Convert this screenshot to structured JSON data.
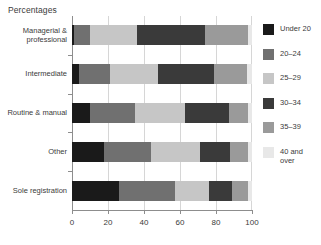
{
  "chart_data": {
    "type": "bar",
    "orientation": "horizontal",
    "stacked": true,
    "normalized": true,
    "title": "Percentages",
    "xlabel": "",
    "ylabel": "",
    "xlim": [
      0,
      100
    ],
    "xticks": [
      0,
      20,
      40,
      60,
      80,
      100
    ],
    "xtick_labels": [
      "0",
      "20",
      "40",
      "60",
      "80",
      "100"
    ],
    "grid": true,
    "grid_axis": "x",
    "legend_position": "right",
    "categories": [
      "Managerial &\nprofessional",
      "Intermediate",
      "Routine & manual",
      "Other",
      "Sole registration"
    ],
    "series": [
      {
        "name": "Under 20",
        "color": "#1a1a1a",
        "values": [
          1,
          4,
          10,
          18,
          26
        ]
      },
      {
        "name": "20–24",
        "color": "#707070",
        "values": [
          9,
          17,
          25,
          26,
          31
        ]
      },
      {
        "name": "25–29",
        "color": "#c6c6c6",
        "values": [
          26,
          27,
          28,
          27,
          19
        ]
      },
      {
        "name": "30–34",
        "color": "#3a3a3a",
        "values": [
          38,
          31,
          24,
          17,
          13
        ]
      },
      {
        "name": "35–39",
        "color": "#9a9a9a",
        "values": [
          24,
          18,
          11,
          10,
          9
        ]
      },
      {
        "name": "40 and\nover",
        "color": "#e8e8e8",
        "values": [
          2,
          3,
          2,
          2,
          2
        ]
      }
    ]
  },
  "legend": {
    "items": [
      {
        "label": "Under 20"
      },
      {
        "label": "20–24"
      },
      {
        "label": "25–29"
      },
      {
        "label": "30–34"
      },
      {
        "label": "35–39"
      },
      {
        "label": "40 and\nover"
      }
    ]
  },
  "colors": {
    "axis": "#8d8d8d",
    "grid": "#d6d6d6",
    "text": "#3b3b3b",
    "background": "#ffffff"
  }
}
